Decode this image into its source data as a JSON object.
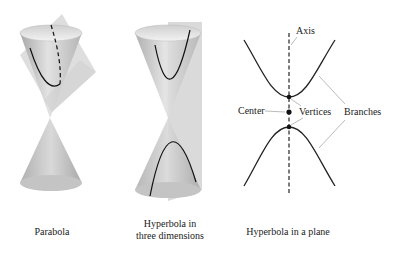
{
  "panels": [
    {
      "id": "parabola",
      "caption_lines": [
        "Parabola"
      ]
    },
    {
      "id": "hyperbola-3d",
      "caption_lines": [
        "Hyperbola in",
        "three dimensions"
      ]
    },
    {
      "id": "hyperbola-plane",
      "caption_lines": [
        "Hyperbola in a plane"
      ]
    }
  ],
  "labels": {
    "axis": "Axis",
    "center": "Center",
    "vertices": "Vertices",
    "branches": "Branches"
  },
  "colors": {
    "cone_light": "#e6e6e6",
    "cone_mid": "#bdbdbd",
    "cone_dark": "#9a9a9a",
    "plane": "#d4d4d4",
    "curve": "#111111",
    "leader": "#aaaaaa"
  }
}
